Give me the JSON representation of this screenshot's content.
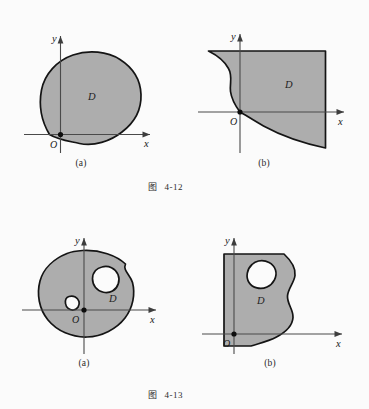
{
  "figures": [
    {
      "caption_prefix": "图",
      "caption_number": "4-12",
      "panels": [
        {
          "sublabel": "(a)",
          "region_label": "D",
          "origin_label": "O",
          "x_axis_label": "x",
          "y_axis_label": "y",
          "description": "simply-connected closed blob region D touching the origin at its lower-left boundary"
        },
        {
          "sublabel": "(b)",
          "region_label": "D",
          "origin_label": "O",
          "x_axis_label": "x",
          "y_axis_label": "y",
          "description": "unbounded-looking region D bounded on the left by an S-shaped curve through the origin and on the bottom by a descending curve"
        }
      ]
    },
    {
      "caption_prefix": "图",
      "caption_number": "4-13",
      "panels": [
        {
          "sublabel": "(a)",
          "region_label": "D",
          "origin_label": "O",
          "x_axis_label": "x",
          "y_axis_label": "y",
          "description": "multiply-connected blob region D with two holes, origin inside the region"
        },
        {
          "sublabel": "(b)",
          "region_label": "D",
          "origin_label": "O",
          "x_axis_label": "x",
          "y_axis_label": "y",
          "description": "region D with straight left edge, wavy right boundary and one interior hole"
        }
      ]
    }
  ],
  "colors": {
    "page_background": "#fbfbfb",
    "region_fill": "#adadad",
    "region_outline": "#141414",
    "axis": "#4a4a4a",
    "hole_fill": "#fcfcfc",
    "text": "#1a1a1a"
  }
}
